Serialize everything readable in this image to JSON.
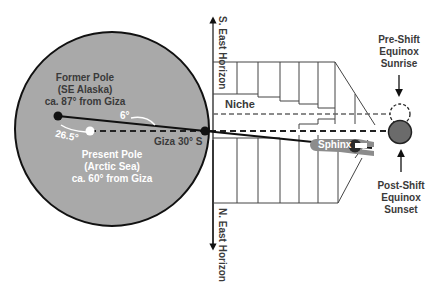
{
  "diagram": {
    "labels": {
      "former_pole": [
        "Former Pole",
        "(SE Alaska)",
        "ca. 87° from Giza"
      ],
      "present_pole": [
        "Present Pole",
        "(Arctic Sea)",
        "ca. 60° from Giza"
      ],
      "giza": "Giza 30° S",
      "angle_small": "6°",
      "angle_large": "26.5°",
      "niche": "Niche",
      "sphinx": "Sphinx",
      "se_horizon": [
        "S. East",
        "Horizon"
      ],
      "ne_horizon": [
        "N. East",
        "Horizon"
      ],
      "pre_shift": [
        "Pre-Shift",
        "Equinox",
        "Sunrise"
      ],
      "post_shift": [
        "Post-Shift",
        "Equinox",
        "Sunset"
      ]
    },
    "colors": {
      "globe_fill": "#a9a9a9",
      "outline": "#111111",
      "sphinx_fill": "#8c8c8c",
      "sun_fill": "#6b6b6b",
      "text_dark": "#3a3a3a",
      "text_light": "#ffffff"
    }
  }
}
